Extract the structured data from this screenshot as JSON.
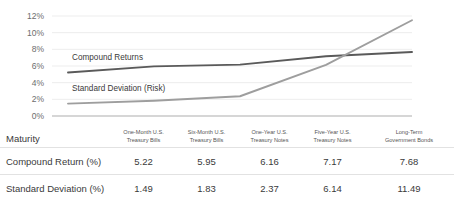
{
  "chart_data": {
    "type": "line",
    "title": "",
    "xlabel": "",
    "ylabel": "",
    "categories": [
      "One-Month U.S. Treasury Bills",
      "Six-Month U.S. Treasury Bills",
      "One-Year U.S. Treasury Notes",
      "Five-Year U.S. Treasury Notes",
      "Long-Term Government Bonds"
    ],
    "series": [
      {
        "name": "Compound Returns",
        "color": "#5a5a5a",
        "values": [
          5.22,
          5.95,
          6.16,
          7.17,
          7.68
        ]
      },
      {
        "name": "Standard Deviation (Risk)",
        "color": "#9e9e9e",
        "values": [
          1.49,
          1.83,
          2.37,
          6.14,
          11.49
        ]
      }
    ],
    "ylim": [
      0,
      12
    ],
    "ytick_labels": [
      "0%",
      "2%",
      "4%",
      "6%",
      "8%",
      "10%",
      "12%"
    ],
    "ytick_values": [
      0,
      2,
      4,
      6,
      8,
      10,
      12
    ],
    "grid": true,
    "legend_position": "inline-annotations",
    "annotations": [
      {
        "text": "Compound Returns",
        "series": "Compound Returns"
      },
      {
        "text": "Standard Deviation (Risk)",
        "series": "Standard Deviation (Risk)"
      }
    ]
  },
  "table": {
    "row_header_label": "Maturity",
    "columns": [
      {
        "line1": "One-Month U.S.",
        "line2": "Treasury Bills"
      },
      {
        "line1": "Six-Month U.S.",
        "line2": "Treasury Bills"
      },
      {
        "line1": "One-Year U.S.",
        "line2": "Treasury Notes"
      },
      {
        "line1": "Five-Year U.S.",
        "line2": "Treasury Notes"
      },
      {
        "line1": "Long-Term",
        "line2": "Government Bonds"
      }
    ],
    "rows": [
      {
        "label": "Compound Return (%)",
        "values": [
          "5.22",
          "5.95",
          "6.16",
          "7.17",
          "7.68"
        ]
      },
      {
        "label": "Standard Deviation (%)",
        "values": [
          "1.49",
          "1.83",
          "2.37",
          "6.14",
          "11.49"
        ]
      }
    ]
  },
  "colors": {
    "compound_line": "#5a5a5a",
    "risk_line": "#9e9e9e",
    "gridline": "#ededed",
    "baseline": "#c9c9c9",
    "table_rule": "#e2e2e2"
  }
}
